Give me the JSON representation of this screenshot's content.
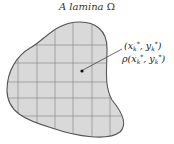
{
  "title": {
    "prefix": "A lamina",
    "symbol": "Ω"
  },
  "labels": {
    "point": {
      "open": "(",
      "x": "x",
      "sep": ", ",
      "y": "y",
      "close": ")",
      "sub": "k",
      "sup": "*"
    },
    "density": {
      "rho": "ρ",
      "open": "(",
      "x": "x",
      "sep": ", ",
      "y": "y",
      "close": ")",
      "sub": "k",
      "sup": "*"
    }
  },
  "colors": {
    "fill": "#d9d9d9",
    "outline": "#555555",
    "grid": "#8c8c8c",
    "text": "#333333"
  },
  "grid": {
    "vertical_x": [
      18,
      37,
      55,
      73,
      92,
      110
    ],
    "horizontal_y": [
      45,
      63,
      82,
      98,
      116
    ]
  },
  "point": {
    "x": 82,
    "y": 71
  }
}
